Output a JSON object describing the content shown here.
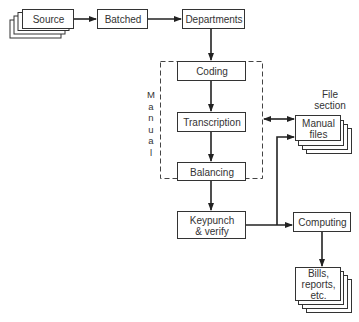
{
  "diagram": {
    "title": "",
    "nodes": {
      "source": {
        "label": "Source",
        "shape": "document-stack"
      },
      "batched": {
        "label": "Batched",
        "shape": "box"
      },
      "departments": {
        "label": "Departments",
        "shape": "box"
      },
      "coding": {
        "label": "Coding",
        "shape": "box"
      },
      "transcription": {
        "label": "Transcription",
        "shape": "box"
      },
      "balancing": {
        "label": "Balancing",
        "shape": "box"
      },
      "keypunch": {
        "label_line1": "Keypunch",
        "label_line2": "& verify",
        "shape": "box"
      },
      "manual_files": {
        "label_line1": "Manual",
        "label_line2": "files",
        "shape": "document-stack"
      },
      "computing": {
        "label": "Computing",
        "shape": "box"
      },
      "bills": {
        "label_line1": "Bills,",
        "label_line2": "reports,",
        "label_line3": "etc.",
        "shape": "document-stack"
      }
    },
    "groups": {
      "manual": {
        "label_letters": [
          "M",
          "a",
          "n",
          "u",
          "a",
          "l"
        ],
        "style": "dashed"
      }
    },
    "annotations": {
      "file_section_line1": "File",
      "file_section_line2": "section"
    },
    "edges": [
      {
        "from": "source",
        "to": "batched"
      },
      {
        "from": "batched",
        "to": "departments"
      },
      {
        "from": "departments",
        "to": "coding"
      },
      {
        "from": "coding",
        "to": "transcription"
      },
      {
        "from": "transcription",
        "to": "balancing"
      },
      {
        "from": "balancing",
        "to": "keypunch"
      },
      {
        "from": "manual",
        "to": "manual_files",
        "bidirectional": true
      },
      {
        "from": "keypunch",
        "to": "manual_files"
      },
      {
        "from": "keypunch",
        "to": "computing"
      },
      {
        "from": "computing",
        "to": "bills"
      }
    ],
    "colors": {
      "line": "#222222",
      "background": "#ffffff"
    }
  }
}
